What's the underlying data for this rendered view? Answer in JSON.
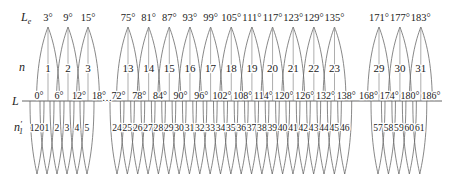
{
  "figure": {
    "row_labels": {
      "le_main": "L",
      "le_sub": "e",
      "n": "n",
      "l_axis": "L",
      "n1_main": "n",
      "n1_prime": "′",
      "n1_sub": "1"
    },
    "ellipsis": "…",
    "groups": [
      {
        "arches": [
          {
            "angle": "3°",
            "n": "1"
          },
          {
            "angle": "9°",
            "n": "2"
          },
          {
            "angle": "15°",
            "n": "3"
          }
        ],
        "ticks": [
          "0°",
          "6°",
          "12°",
          "18°"
        ],
        "lobes": [
          "120",
          "1",
          "2",
          "3",
          "4",
          "5"
        ]
      },
      {
        "arches": [
          {
            "angle": "75°",
            "n": "13"
          },
          {
            "angle": "81°",
            "n": "14"
          },
          {
            "angle": "87°",
            "n": "15"
          },
          {
            "angle": "93°",
            "n": "16"
          },
          {
            "angle": "99°",
            "n": "17"
          },
          {
            "angle": "105°",
            "n": "18"
          },
          {
            "angle": "111°",
            "n": "19"
          },
          {
            "angle": "117°",
            "n": "20"
          },
          {
            "angle": "123°",
            "n": "21"
          },
          {
            "angle": "129°",
            "n": "22"
          },
          {
            "angle": "135°",
            "n": "23"
          }
        ],
        "ticks": [
          "72°",
          "78°",
          "84°",
          "90°",
          "96°",
          "102°",
          "108°",
          "114°",
          "120°",
          "126°",
          "132°",
          "138°"
        ],
        "lobes": [
          "24",
          "25",
          "26",
          "27",
          "28",
          "29",
          "30",
          "31",
          "32",
          "33",
          "34",
          "35",
          "36",
          "37",
          "38",
          "39",
          "40",
          "41",
          "42",
          "43",
          "44",
          "45",
          "46"
        ]
      },
      {
        "arches": [
          {
            "angle": "171°",
            "n": "29"
          },
          {
            "angle": "177°",
            "n": "30"
          },
          {
            "angle": "183°",
            "n": "31"
          }
        ],
        "ticks": [
          "168°",
          "174°",
          "180°",
          "186°"
        ],
        "lobes": [
          "57",
          "58",
          "59",
          "60",
          "61"
        ]
      }
    ]
  }
}
